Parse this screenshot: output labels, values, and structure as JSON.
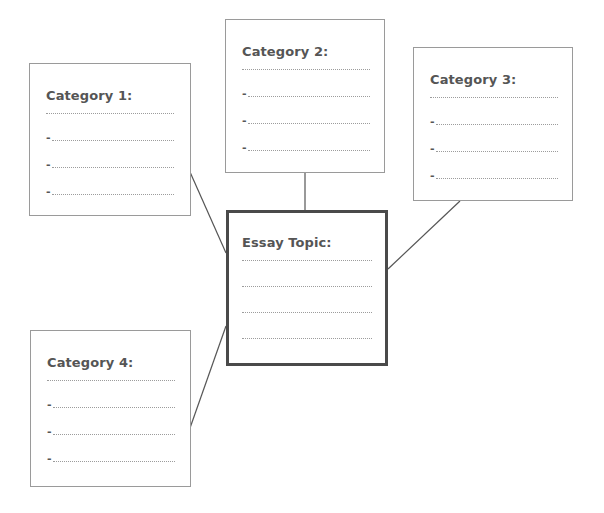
{
  "diagram": {
    "type": "essay-planning-web",
    "center": {
      "id": "topic",
      "title": "Essay Topic:",
      "blank_lines": 4,
      "bullet_lines": 0
    },
    "categories": [
      {
        "id": "cat1",
        "title": "Category 1:",
        "blank_lines": 1,
        "bullet_lines": 3,
        "bullet": "-"
      },
      {
        "id": "cat2",
        "title": "Category 2:",
        "blank_lines": 1,
        "bullet_lines": 3,
        "bullet": "-"
      },
      {
        "id": "cat3",
        "title": "Category 3:",
        "blank_lines": 1,
        "bullet_lines": 3,
        "bullet": "-"
      },
      {
        "id": "cat4",
        "title": "Category 4:",
        "blank_lines": 1,
        "bullet_lines": 3,
        "bullet": "-"
      }
    ],
    "connections": [
      {
        "from": "cat1",
        "to": "topic"
      },
      {
        "from": "cat2",
        "to": "topic"
      },
      {
        "from": "cat3",
        "to": "topic"
      },
      {
        "from": "cat4",
        "to": "topic"
      }
    ],
    "colors": {
      "title_text": "#555555",
      "box_border": "#9a9a9a",
      "topic_border": "#4a4a4a",
      "connector": "#555555",
      "dotted_line": "#9c9c9c"
    }
  }
}
